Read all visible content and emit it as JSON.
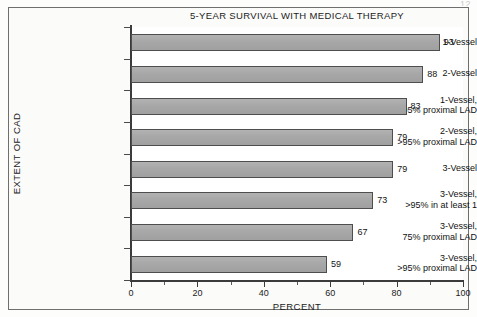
{
  "page_marker": "12",
  "chart_data": {
    "type": "bar",
    "orientation": "horizontal",
    "title": "5-YEAR SURVIVAL WITH MEDICAL THERAPY",
    "xlabel": "PERCENT",
    "ylabel": "EXTENT OF CAD",
    "categories": [
      "1-Vessel",
      "2-Vessel",
      "1-Vessel,\n>95% proximal LAD",
      "2-Vessel,\n>95% proximal LAD",
      "3-Vessel",
      "3-Vessel,\n>95% in at least 1",
      "3-Vessel,\n75% proximal LAD",
      "3-Vessel,\n>95% proximal LAD"
    ],
    "values": [
      93,
      88,
      83,
      79,
      79,
      73,
      67,
      59
    ],
    "value_labels": [
      "93",
      "88",
      "83",
      "79",
      "79",
      "73",
      "67",
      "59"
    ],
    "xlim": [
      0,
      100
    ],
    "xticks": [
      0,
      20,
      40,
      60,
      80,
      100
    ],
    "xtick_labels": [
      "0",
      "20",
      "40",
      "60",
      "80",
      "100"
    ],
    "xticks_minor": [
      10,
      30,
      50,
      70,
      90
    ],
    "grid": false,
    "legend": null,
    "bar_color": "#a9a9a9",
    "bar_edge_color": "#4e4e4e",
    "plot_background": "#ffffff",
    "figure_background": "#fbfbfa"
  }
}
